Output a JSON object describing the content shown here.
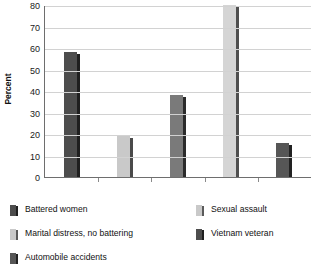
{
  "chart_data": {
    "type": "bar",
    "title": "",
    "xlabel": "",
    "ylabel": "Percent",
    "ylim": [
      0,
      80
    ],
    "ytick_labels": [
      "80",
      "70",
      "60",
      "50",
      "40",
      "30",
      "20",
      "10",
      "0"
    ],
    "ytick_values": [
      80,
      70,
      60,
      50,
      40,
      30,
      20,
      10,
      0
    ],
    "grid": true,
    "legend_position": "bottom",
    "categories": [
      "Battered women",
      "Sexual assault",
      "Marital distress, no battering",
      "Vietnam veteran",
      "Automobile accidents"
    ],
    "values": [
      58,
      19,
      38,
      80,
      16
    ],
    "bar_colors": [
      "#4d4d4d",
      "#c9c9c9",
      "#7a7a7a",
      "#d5d5d5",
      "#565656"
    ],
    "bar_side_colors": [
      "#1f1f1f",
      "#4a4a4a",
      "#2b2b2b",
      "#4f4f4f",
      "#222222"
    ]
  },
  "legend": {
    "columns": [
      {
        "items": [
          {
            "label": "Battered women",
            "color": "#4d4d4d",
            "side": "#1f1f1f"
          },
          {
            "label": "Marital distress, no battering",
            "color": "#c9c9c9",
            "side": "#5a5a5a"
          },
          {
            "label": "Automobile accidents",
            "color": "#565656",
            "side": "#222222"
          }
        ]
      },
      {
        "items": [
          {
            "label": "Sexual assault",
            "color": "#c9c9c9",
            "side": "#5a5a5a"
          },
          {
            "label": "Vietnam veteran",
            "color": "#4d4d4d",
            "side": "#1f1f1f"
          }
        ]
      }
    ]
  }
}
